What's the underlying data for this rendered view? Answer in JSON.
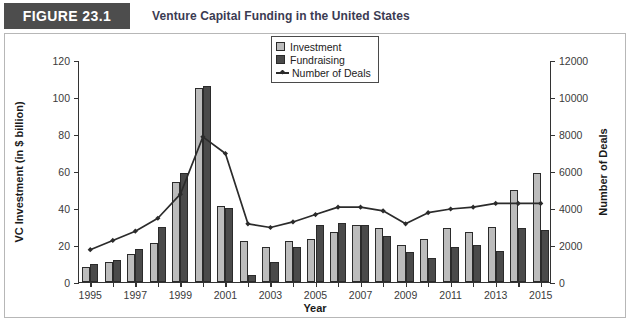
{
  "header": {
    "badge_label": "FIGURE 23.1",
    "title": "Venture Capital Funding in the United States",
    "badge_color": "#4d4d4d"
  },
  "legend": {
    "items": [
      {
        "label": "Investment",
        "marker": "square-swatch",
        "color": "#bcbcbc"
      },
      {
        "label": "Fundraising",
        "marker": "square-swatch",
        "color": "#4a4a4a"
      },
      {
        "label": "Number of Deals",
        "marker": "line-with-diamond",
        "color": "#2b2b2b"
      }
    ]
  },
  "chart_data": {
    "type": "bar",
    "title": "Venture Capital Funding in the United States",
    "xlabel": "Year",
    "ylabel": "VC Investment (in $ billion)",
    "y2label": "Number of Deals",
    "ylim": [
      0,
      120
    ],
    "y2lim": [
      0,
      12000
    ],
    "yticks": [
      "0",
      "20",
      "40",
      "60",
      "80",
      "100",
      "120"
    ],
    "y2ticks": [
      "0",
      "2000",
      "4000",
      "6000",
      "8000",
      "10000",
      "12000"
    ],
    "xticks": [
      "1995",
      "1997",
      "1999",
      "2001",
      "2003",
      "2005",
      "2007",
      "2009",
      "2011",
      "2013",
      "2015"
    ],
    "grid": false,
    "legend_position": "top-center",
    "categories": [
      1995,
      1996,
      1997,
      1998,
      1999,
      2000,
      2001,
      2002,
      2003,
      2004,
      2005,
      2006,
      2007,
      2008,
      2009,
      2010,
      2011,
      2012,
      2013,
      2014,
      2015
    ],
    "series": [
      {
        "name": "Investment",
        "axis": "left",
        "units": "$ billion",
        "type": "bar",
        "color": "#bcbcbc",
        "values": [
          8,
          11,
          15,
          21,
          54,
          105,
          41,
          22,
          19,
          22,
          23,
          27,
          31,
          29,
          20,
          23,
          29,
          27,
          30,
          50,
          59
        ]
      },
      {
        "name": "Fundraising",
        "axis": "left",
        "units": "$ billion",
        "type": "bar",
        "color": "#4a4a4a",
        "values": [
          10,
          12,
          18,
          30,
          59,
          106,
          40,
          4,
          11,
          19,
          31,
          32,
          31,
          25,
          16,
          13,
          19,
          20,
          17,
          29,
          28
        ]
      },
      {
        "name": "Number of Deals",
        "axis": "right",
        "units": "deals",
        "type": "line",
        "color": "#2b2b2b",
        "values": [
          1800,
          2300,
          2800,
          3500,
          4800,
          7900,
          7000,
          3200,
          3000,
          3300,
          3700,
          4100,
          4100,
          3900,
          3200,
          3800,
          4000,
          4100,
          4300,
          4300,
          4300
        ]
      }
    ]
  }
}
